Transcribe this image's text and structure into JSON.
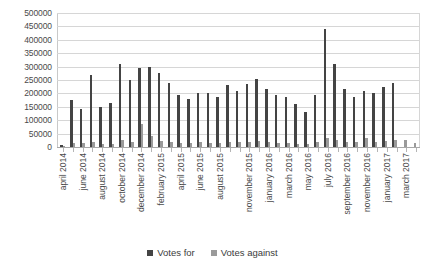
{
  "chart_data": {
    "type": "bar",
    "title": "",
    "xlabel": "",
    "ylabel": "",
    "ylim": [
      0,
      500000
    ],
    "ytick_step": 50000,
    "yticks": [
      "500000",
      "450000",
      "400000",
      "350000",
      "300000",
      "250000",
      "200000",
      "150000",
      "100000",
      "50000",
      "0"
    ],
    "grid": true,
    "legend_position": "bottom",
    "bar_colors": {
      "votes_for": "#444444",
      "votes_against": "#9a9a9a"
    },
    "categories": [
      "april 2014",
      "may 2014",
      "june 2014",
      "july 2014",
      "august 2014",
      "september 2014",
      "october 2014",
      "november 2014",
      "december 2014",
      "january 2015",
      "february 2015",
      "march 2015",
      "april 2015",
      "may 2015",
      "june 2015",
      "july 2015",
      "august 2015",
      "september 2015",
      "october 2015",
      "november 2015",
      "december 2015",
      "january 2016",
      "february 2016",
      "march 2016",
      "april 2016",
      "may 2016",
      "june 2016",
      "july 2016",
      "august 2016",
      "september 2016",
      "october 2016",
      "november 2016",
      "december 2016",
      "january 2017",
      "february 2017",
      "march 2017",
      "april 2017"
    ],
    "tick_labels": [
      "april 2014",
      "",
      "june 2014",
      "",
      "august 2014",
      "",
      "october 2014",
      "",
      "december 2014",
      "",
      "february 2015",
      "",
      "april 2015",
      "",
      "june 2015",
      "",
      "august 2015",
      "",
      "",
      "november 2015",
      "",
      "january 2016",
      "",
      "march 2016",
      "",
      "may 2016",
      "",
      "july 2016",
      "",
      "september 2016",
      "",
      "november 2016",
      "",
      "january 2017",
      "",
      "march 2017",
      ""
    ],
    "series": [
      {
        "name": "Votes for",
        "values": [
          8000,
          175000,
          140000,
          270000,
          150000,
          165000,
          310000,
          250000,
          295000,
          300000,
          275000,
          240000,
          195000,
          180000,
          200000,
          200000,
          185000,
          230000,
          210000,
          235000,
          255000,
          215000,
          195000,
          185000,
          160000,
          130000,
          195000,
          440000,
          310000,
          215000,
          185000,
          210000,
          200000,
          225000,
          240000,
          0,
          0
        ]
      },
      {
        "name": "Votes against",
        "values": [
          3000,
          15000,
          14000,
          18000,
          12000,
          13000,
          25000,
          20000,
          85000,
          40000,
          22000,
          18000,
          15000,
          14000,
          20000,
          16000,
          15000,
          18000,
          17000,
          20000,
          22000,
          18000,
          16000,
          15000,
          12000,
          12000,
          20000,
          32000,
          26000,
          20000,
          17000,
          35000,
          18000,
          22000,
          26000,
          28000,
          16000
        ]
      }
    ]
  },
  "legend": {
    "items": [
      {
        "label": "Votes for"
      },
      {
        "label": "Votes against"
      }
    ]
  }
}
